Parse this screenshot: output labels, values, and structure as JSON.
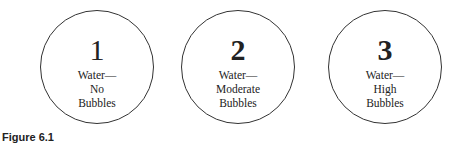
{
  "figure": {
    "caption": "Figure 6.1",
    "circles": [
      {
        "number": "1",
        "line1": "Water—",
        "line2": "No",
        "line3": "Bubbles"
      },
      {
        "number": "2",
        "line1": "Water—",
        "line2": "Moderate",
        "line3": "Bubbles"
      },
      {
        "number": "3",
        "line1": "Water—",
        "line2": "High",
        "line3": "Bubbles"
      }
    ]
  }
}
